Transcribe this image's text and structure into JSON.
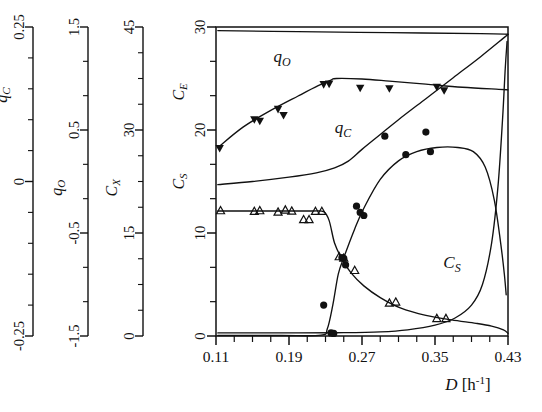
{
  "figure": {
    "background": "#ffffff",
    "ink": "#111111",
    "width": 542,
    "height": 412
  },
  "xaxis": {
    "label_var": "D",
    "label_units": "[h",
    "label_exp": "-1",
    "label_units_close": "]",
    "label_full": "D [h-1]",
    "min": 0.11,
    "max": 0.43,
    "major_ticks": [
      0.11,
      0.19,
      0.27,
      0.35,
      0.43
    ],
    "tick_labels": [
      "0.11",
      "0.19",
      "0.27",
      "0.35",
      "0.43"
    ],
    "minor_step": 0.02
  },
  "yaxes": [
    {
      "name": "qC-axis",
      "title": "q",
      "title_sub": "C",
      "min": -0.25,
      "max": 0.25,
      "major_ticks": [
        -0.25,
        0,
        0.25
      ],
      "tick_labels": [
        "-0.25",
        "0",
        "0.25"
      ],
      "minor_count": 4
    },
    {
      "name": "qO-axis",
      "title": "q",
      "title_sub": "O",
      "min": -1.5,
      "max": 1.5,
      "major_ticks": [
        -1.5,
        -0.5,
        0.5,
        1.5
      ],
      "tick_labels": [
        "-1.5",
        "-0.5",
        "0.5",
        "1.5"
      ],
      "minor_count": 2
    },
    {
      "name": "CX-axis",
      "title": "C",
      "title_sub": "X",
      "min": 0,
      "max": 45,
      "major_ticks": [
        0,
        15,
        30,
        45
      ],
      "tick_labels": [
        "0",
        "15",
        "30",
        "45"
      ],
      "minor_count": 3
    },
    {
      "name": "main-axis",
      "title_upper": "C",
      "title_upper_sub": "E",
      "title_lower": "C",
      "title_lower_sub": "S",
      "min": 0,
      "max": 30,
      "major_ticks": [
        0,
        10,
        20,
        30
      ],
      "tick_labels": [
        "0",
        "10",
        "20",
        "30"
      ],
      "minor_count": 2
    }
  ],
  "curve_labels": [
    {
      "name": "qO-label",
      "text": "q",
      "sub": "O",
      "x": 282,
      "y": 62
    },
    {
      "name": "qC-label",
      "text": "q",
      "sub": "C",
      "x": 343,
      "y": 133
    },
    {
      "name": "CS-label",
      "text": "C",
      "sub": "S",
      "x": 452,
      "y": 268
    }
  ],
  "chart_data": {
    "type": "line",
    "title": "",
    "xlabel": "D [h-1]",
    "ylabel": "CE / CS / CX / qO / qC",
    "xlim": [
      0.11,
      0.43
    ],
    "grid": false,
    "legend": "inline-curve-labels",
    "series": [
      {
        "name": "qO",
        "axis": "qO-axis",
        "marker": "triangle-down-filled",
        "line": "solid",
        "curve": [
          [
            0.112,
            0.33
          ],
          [
            0.14,
            0.53
          ],
          [
            0.17,
            0.69
          ],
          [
            0.2,
            0.83
          ],
          [
            0.222,
            0.93
          ],
          [
            0.236,
            0.985
          ],
          [
            0.242,
            1.0
          ],
          [
            0.27,
            0.995
          ],
          [
            0.3,
            0.975
          ],
          [
            0.34,
            0.945
          ],
          [
            0.38,
            0.915
          ],
          [
            0.42,
            0.895
          ],
          [
            0.43,
            0.89
          ]
        ],
        "points": [
          [
            0.114,
            0.32
          ],
          [
            0.152,
            0.6
          ],
          [
            0.158,
            0.585
          ],
          [
            0.178,
            0.7
          ],
          [
            0.184,
            0.64
          ],
          [
            0.228,
            0.94
          ],
          [
            0.234,
            0.945
          ],
          [
            0.268,
            0.905
          ],
          [
            0.3,
            0.9
          ],
          [
            0.352,
            0.915
          ],
          [
            0.36,
            0.88
          ]
        ]
      },
      {
        "name": "qC",
        "axis": "qC-axis",
        "marker": "none",
        "line": "solid",
        "curve": [
          [
            0.112,
            -0.005
          ],
          [
            0.15,
            0.0
          ],
          [
            0.19,
            0.007
          ],
          [
            0.22,
            0.014
          ],
          [
            0.24,
            0.022
          ],
          [
            0.255,
            0.033
          ],
          [
            0.27,
            0.052
          ],
          [
            0.29,
            0.076
          ],
          [
            0.31,
            0.1
          ],
          [
            0.34,
            0.134
          ],
          [
            0.37,
            0.168
          ],
          [
            0.4,
            0.202
          ],
          [
            0.425,
            0.232
          ],
          [
            0.43,
            0.238
          ]
        ],
        "points": []
      },
      {
        "name": "CE",
        "axis": "main-axis",
        "marker": "circle-filled",
        "line": "solid",
        "curve": [
          [
            0.112,
            0.05
          ],
          [
            0.18,
            0.05
          ],
          [
            0.225,
            0.08
          ],
          [
            0.232,
            0.7
          ],
          [
            0.238,
            3.0
          ],
          [
            0.244,
            6.0
          ],
          [
            0.25,
            7.6
          ],
          [
            0.262,
            10.4
          ],
          [
            0.272,
            12.4
          ],
          [
            0.29,
            15.2
          ],
          [
            0.31,
            17.0
          ],
          [
            0.33,
            17.9
          ],
          [
            0.352,
            18.3
          ],
          [
            0.375,
            18.3
          ],
          [
            0.392,
            17.9
          ],
          [
            0.405,
            16.4
          ],
          [
            0.415,
            13.2
          ],
          [
            0.422,
            9.0
          ],
          [
            0.426,
            6.0
          ],
          [
            0.428,
            4.0
          ]
        ],
        "points": [
          [
            0.228,
            3.0
          ],
          [
            0.236,
            0.3
          ],
          [
            0.239,
            0.25
          ],
          [
            0.248,
            7.6
          ],
          [
            0.25,
            7.55
          ],
          [
            0.252,
            6.9
          ],
          [
            0.264,
            12.6
          ],
          [
            0.268,
            12.0
          ],
          [
            0.272,
            11.7
          ],
          [
            0.295,
            19.4
          ],
          [
            0.318,
            17.6
          ],
          [
            0.34,
            19.8
          ],
          [
            0.345,
            17.9
          ]
        ]
      },
      {
        "name": "CX",
        "axis": "CX-axis",
        "marker": "triangle-up-open",
        "line": "solid",
        "curve": [
          [
            0.112,
            18.2
          ],
          [
            0.18,
            18.2
          ],
          [
            0.215,
            18.2
          ],
          [
            0.228,
            18.1
          ],
          [
            0.234,
            16.8
          ],
          [
            0.24,
            13.5
          ],
          [
            0.248,
            11.2
          ],
          [
            0.258,
            9.2
          ],
          [
            0.272,
            7.3
          ],
          [
            0.29,
            5.6
          ],
          [
            0.312,
            4.1
          ],
          [
            0.34,
            3.0
          ],
          [
            0.368,
            2.35
          ],
          [
            0.395,
            1.85
          ],
          [
            0.412,
            1.45
          ],
          [
            0.425,
            0.9
          ],
          [
            0.43,
            0.4
          ]
        ],
        "points": [
          [
            0.115,
            18.3
          ],
          [
            0.152,
            18.2
          ],
          [
            0.158,
            18.3
          ],
          [
            0.178,
            18.1
          ],
          [
            0.186,
            18.4
          ],
          [
            0.193,
            18.25
          ],
          [
            0.206,
            17.0
          ],
          [
            0.212,
            17.0
          ],
          [
            0.219,
            18.2
          ],
          [
            0.226,
            18.2
          ],
          [
            0.245,
            11.6
          ],
          [
            0.25,
            11.4
          ],
          [
            0.262,
            9.6
          ],
          [
            0.3,
            4.85
          ],
          [
            0.307,
            5.0
          ],
          [
            0.352,
            2.6
          ],
          [
            0.362,
            2.6
          ]
        ]
      },
      {
        "name": "CS",
        "axis": "main-axis",
        "marker": "none",
        "line": "solid",
        "curve": [
          [
            0.112,
            0.3
          ],
          [
            0.2,
            0.3
          ],
          [
            0.25,
            0.32
          ],
          [
            0.29,
            0.4
          ],
          [
            0.32,
            0.6
          ],
          [
            0.35,
            1.05
          ],
          [
            0.372,
            1.75
          ],
          [
            0.39,
            3.0
          ],
          [
            0.402,
            5.0
          ],
          [
            0.412,
            9.0
          ],
          [
            0.419,
            14.5
          ],
          [
            0.424,
            21.0
          ],
          [
            0.427,
            26.0
          ],
          [
            0.429,
            28.6
          ]
        ],
        "points": []
      },
      {
        "name": "CE-top-envelope",
        "axis": "main-axis",
        "marker": "none",
        "line": "solid",
        "curve": [
          [
            0.112,
            29.65
          ],
          [
            0.2,
            29.55
          ],
          [
            0.3,
            29.45
          ],
          [
            0.4,
            29.35
          ],
          [
            0.43,
            29.3
          ]
        ],
        "points": []
      }
    ]
  }
}
